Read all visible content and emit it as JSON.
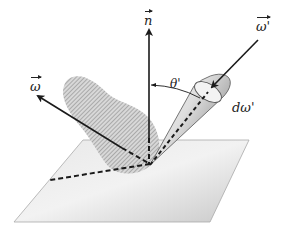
{
  "figure": {
    "type": "radiometry-geometry-diagram"
  },
  "labels": {
    "normal": "n",
    "incident_direction": "ω'",
    "outgoing_direction": "ω",
    "angle": "θ'",
    "solid_angle": "dω'"
  },
  "colors": {
    "stroke": "#1a1a1a",
    "plane_light": "#efefef",
    "plane_dark": "#c8c8c8",
    "hatch": "#8a8a8a",
    "cone_light": "#f4f4f4",
    "cone_dark": "#bdbdbd"
  }
}
